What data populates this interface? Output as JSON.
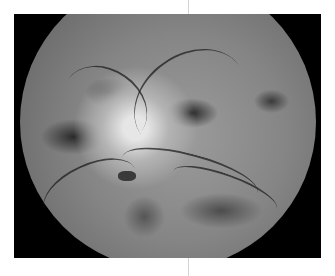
{
  "image": {
    "description": "Grayscale retinal fundus photograph",
    "frame_color": "#000000",
    "background_color": "#ffffff"
  }
}
